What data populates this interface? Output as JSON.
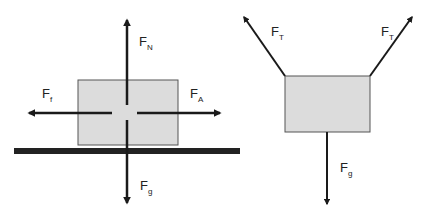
{
  "colors": {
    "box_fill": "#dcdcdc",
    "box_stroke": "#555555",
    "arrow": "#1a1a1a",
    "ground": "#222222"
  },
  "left_diagram": {
    "description": "Block on surface",
    "forces": [
      {
        "id": "normal",
        "main": "F",
        "sub": "N"
      },
      {
        "id": "friction",
        "main": "F",
        "sub": "f"
      },
      {
        "id": "applied",
        "main": "F",
        "sub": "A"
      },
      {
        "id": "gravity",
        "main": "F",
        "sub": "g"
      }
    ]
  },
  "right_diagram": {
    "description": "Hanging block with two tensions",
    "forces": [
      {
        "id": "tension-left",
        "main": "F",
        "sub": "T"
      },
      {
        "id": "tension-right",
        "main": "F",
        "sub": "T"
      },
      {
        "id": "gravity",
        "main": "F",
        "sub": "g"
      }
    ]
  }
}
